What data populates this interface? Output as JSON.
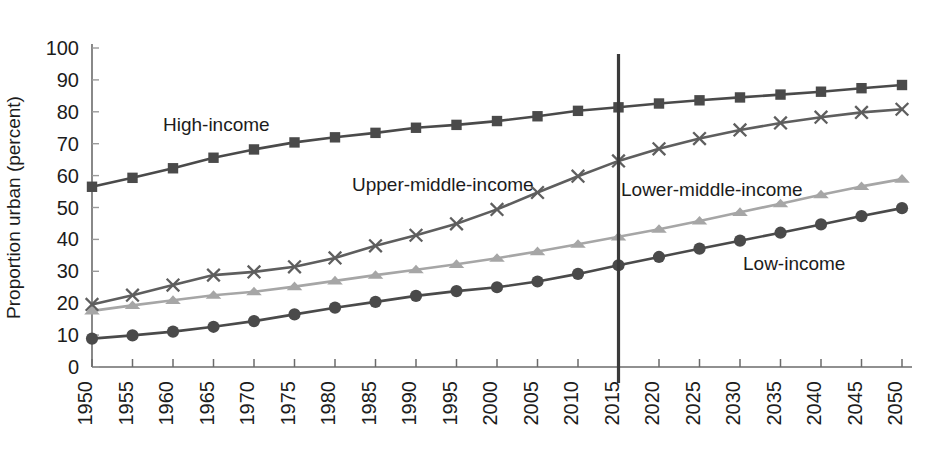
{
  "chart_data": {
    "type": "line",
    "title": "",
    "xlabel": "",
    "ylabel": "Proportion urban (percent)",
    "xlim": [
      1950,
      2050
    ],
    "ylim": [
      0,
      100
    ],
    "ytick_step": 10,
    "xtick_step": 5,
    "grid": false,
    "legend": "inline-annotations",
    "x": [
      1950,
      1955,
      1960,
      1965,
      1970,
      1975,
      1980,
      1985,
      1990,
      1995,
      2000,
      2005,
      2010,
      2015,
      2020,
      2025,
      2030,
      2035,
      2040,
      2045,
      2050
    ],
    "xtick_labels": [
      "1950",
      "1955",
      "1960",
      "1965",
      "1970",
      "1975",
      "1980",
      "1985",
      "1990",
      "1995",
      "2000",
      "2005",
      "2010",
      "2015",
      "2020",
      "2025",
      "2030",
      "2035",
      "2040",
      "2045",
      "2050"
    ],
    "ytick_labels": [
      "0",
      "10",
      "20",
      "30",
      "40",
      "50",
      "60",
      "70",
      "80",
      "90",
      "100"
    ],
    "annotations": [
      {
        "text": "High-income",
        "x_px": 163,
        "y_px": 131,
        "series": "High-income"
      },
      {
        "text": "Upper-middle-income",
        "x_px": 352,
        "y_px": 191,
        "series": "Upper-middle-income"
      },
      {
        "text": "Lower-middle-income",
        "x_px": 621,
        "y_px": 196,
        "series": "Lower-middle-income"
      },
      {
        "text": "Low-income",
        "x_px": 743,
        "y_px": 270,
        "series": "Low-income"
      }
    ],
    "reference_line": {
      "x": 2015,
      "label": "",
      "color": "#3a3a3a"
    },
    "series": [
      {
        "name": "High-income",
        "marker": "square",
        "color": "#4a4a4a",
        "values": [
          56.5,
          59.3,
          62.3,
          65.6,
          68.2,
          70.4,
          72.0,
          73.4,
          75.0,
          75.9,
          77.1,
          78.6,
          80.3,
          81.4,
          82.6,
          83.6,
          84.5,
          85.4,
          86.3,
          87.4,
          88.4
        ]
      },
      {
        "name": "Upper-middle-income",
        "marker": "x",
        "color": "#5e5e5e",
        "values": [
          19.6,
          22.5,
          25.7,
          28.8,
          29.8,
          31.4,
          34.2,
          38.0,
          41.3,
          44.9,
          49.4,
          54.7,
          59.8,
          64.6,
          68.4,
          71.6,
          74.3,
          76.5,
          78.3,
          79.8,
          80.8
        ]
      },
      {
        "name": "Lower-middle-income",
        "marker": "triangle",
        "color": "#a6a6a6",
        "values": [
          17.6,
          19.3,
          20.9,
          22.5,
          23.6,
          25.2,
          27.0,
          28.8,
          30.5,
          32.2,
          34.1,
          36.2,
          38.5,
          40.8,
          43.2,
          45.8,
          48.5,
          51.2,
          54.0,
          56.6,
          58.9
        ]
      },
      {
        "name": "Low-income",
        "marker": "circle",
        "color": "#4a4a4a",
        "values": [
          8.9,
          9.9,
          11.1,
          12.6,
          14.4,
          16.5,
          18.6,
          20.4,
          22.3,
          23.8,
          25.0,
          26.8,
          29.2,
          31.9,
          34.5,
          37.1,
          39.6,
          42.1,
          44.7,
          47.3,
          49.8
        ]
      }
    ]
  }
}
